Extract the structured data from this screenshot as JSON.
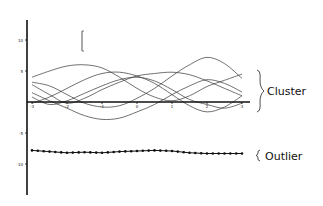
{
  "chart_data": {
    "type": "line",
    "title": "",
    "xlabel": "",
    "ylabel": "",
    "xlim": [
      -3.1,
      3.1
    ],
    "ylim": [
      -12,
      15
    ],
    "x_ticks": [
      -3,
      -2,
      -1,
      0,
      1,
      2,
      3
    ],
    "x_tick_labels": [
      "-3",
      "-2",
      "-1",
      "0",
      "1",
      "2",
      "3"
    ],
    "y_ticks": [
      10,
      5,
      -5,
      -10
    ],
    "y_tick_labels": [
      "10",
      "5",
      "-5",
      "-10"
    ],
    "grid": false,
    "legend": "none",
    "x": [
      -3.0,
      -2.5,
      -2.0,
      -1.5,
      -1.0,
      -0.5,
      0.0,
      0.5,
      1.0,
      1.5,
      2.0,
      2.5,
      3.0
    ],
    "series": [
      {
        "name": "cluster-1",
        "group": "Cluster",
        "values": [
          4.0,
          5.0,
          5.8,
          6.0,
          5.5,
          4.0,
          2.2,
          0.8,
          0.2,
          1.0,
          2.5,
          3.5,
          4.5
        ]
      },
      {
        "name": "cluster-2",
        "group": "Cluster",
        "values": [
          3.2,
          2.6,
          1.2,
          -0.2,
          -0.8,
          -0.6,
          0.6,
          2.2,
          4.2,
          6.0,
          7.2,
          6.2,
          3.8
        ]
      },
      {
        "name": "cluster-3",
        "group": "Cluster",
        "values": [
          1.5,
          0.2,
          -1.0,
          -2.2,
          -2.8,
          -2.6,
          -1.6,
          -0.4,
          1.2,
          2.6,
          3.6,
          3.0,
          1.6
        ]
      },
      {
        "name": "cluster-4",
        "group": "Cluster",
        "values": [
          -0.2,
          0.8,
          2.2,
          3.6,
          4.6,
          4.8,
          4.2,
          3.0,
          1.2,
          -0.6,
          -1.6,
          -0.8,
          1.0
        ]
      },
      {
        "name": "cluster-5",
        "group": "Cluster",
        "values": [
          2.8,
          1.2,
          -0.2,
          0.6,
          2.0,
          3.2,
          4.2,
          4.6,
          4.8,
          4.4,
          3.4,
          2.2,
          1.0
        ]
      },
      {
        "name": "cluster-6",
        "group": "Cluster",
        "values": [
          0.8,
          -0.4,
          0.2,
          1.4,
          2.6,
          3.6,
          4.0,
          3.4,
          2.0,
          0.4,
          -0.4,
          -1.0,
          -0.2
        ]
      },
      {
        "name": "outlier",
        "group": "Outlier",
        "marker": "dot",
        "values": [
          -7.8,
          -8.0,
          -8.2,
          -8.1,
          -8.2,
          -8.0,
          -7.9,
          -7.8,
          -7.9,
          -8.2,
          -8.3,
          -8.3,
          -8.3
        ]
      }
    ],
    "annotations": [
      {
        "type": "brace",
        "text": "Cluster",
        "target": "cluster"
      },
      {
        "type": "brace",
        "text": "Outlier",
        "target": "outlier"
      },
      {
        "type": "scale-bar",
        "text": ""
      }
    ]
  },
  "labels": {
    "cluster": "Cluster",
    "outlier": "Outlier"
  }
}
